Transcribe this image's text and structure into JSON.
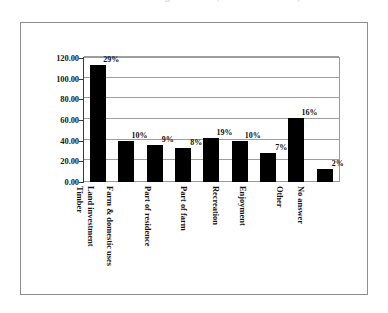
{
  "caption": {
    "text": "Reasons for Owning Woodland (Number of Owners)"
  },
  "chart_data": {
    "type": "bar",
    "title": "",
    "xlabel": "",
    "ylabel": "",
    "ylim": [
      0,
      120
    ],
    "yticks": [
      0,
      20,
      40,
      60,
      80,
      100,
      120
    ],
    "ytick_labels": [
      "0.00",
      "20.00",
      "40.00",
      "60.00",
      "80.00",
      "100.00",
      "120.00"
    ],
    "grid": true,
    "legend": "none",
    "categories": [
      "Timber",
      "Land investment",
      "Farm & domestic uses",
      "Part of residence",
      "Part of farm",
      "Recreation",
      "Enjoyment",
      "Other",
      "No answer"
    ],
    "values": [
      113,
      40,
      36,
      33,
      43,
      40,
      28,
      62,
      13
    ],
    "data_labels": [
      "29%",
      "10%",
      "9%",
      "8%",
      "19%",
      "10%",
      "7%",
      "16%",
      "2%"
    ],
    "bar_color": "#000000"
  }
}
